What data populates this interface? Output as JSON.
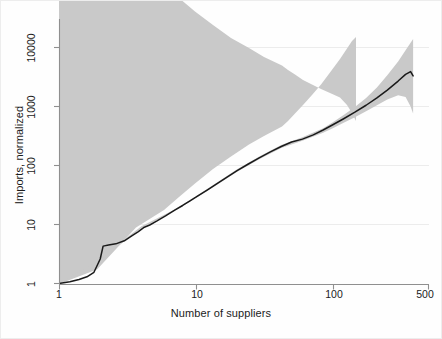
{
  "chart_data": {
    "type": "line",
    "title": "",
    "subtitle": "",
    "xlabel": "Number of suppliers",
    "ylabel": "Imports, normalized",
    "xscale": "log",
    "yscale": "log",
    "xlim": [
      1,
      500
    ],
    "ylim": [
      1,
      20000
    ],
    "grid": true,
    "grid_axis": "y",
    "legend": "none",
    "xticks": [
      1,
      10,
      100,
      500
    ],
    "xtick_labels": [
      "1",
      "10",
      "100",
      "500"
    ],
    "yticks": [
      1,
      10,
      100,
      1000,
      10000
    ],
    "ytick_labels": [
      "1",
      "10",
      "100",
      "1000",
      "10000"
    ],
    "annotations": [],
    "series": [
      {
        "name": "Imports, normalized (mean)",
        "style": "solid-line",
        "color": "#1a1a1a",
        "x": [
          1,
          1.2,
          1.4,
          1.6,
          1.8,
          2.0,
          2.1,
          2.3,
          2.6,
          3.0,
          3.4,
          3.8,
          4.2,
          4.6,
          5.2,
          6.0,
          7.0,
          8.0,
          9.0,
          10,
          12,
          14,
          17,
          20,
          24,
          29,
          35,
          42,
          50,
          60,
          72,
          85,
          100,
          120,
          145,
          175,
          210,
          250,
          300,
          340,
          370,
          386
        ],
        "y": [
          1.0,
          1.07,
          1.17,
          1.3,
          1.55,
          2.6,
          4.3,
          4.5,
          4.7,
          5.3,
          6.4,
          7.6,
          9.0,
          9.8,
          11.5,
          14.0,
          17.5,
          21.0,
          25.0,
          29.0,
          38.0,
          48.0,
          64.0,
          82.0,
          105,
          135,
          170,
          210,
          250,
          280,
          330,
          400,
          490,
          620,
          800,
          1050,
          1400,
          1900,
          2700,
          3500,
          3900,
          3300
        ]
      },
      {
        "name": "95% confidence band (upper)",
        "style": "band-upper",
        "color": "#c9c9c9",
        "x": [
          1,
          2,
          4,
          7,
          10,
          14,
          20,
          29,
          42,
          60,
          85,
          100,
          120,
          145,
          175,
          210,
          250,
          300,
          340,
          370,
          386
        ],
        "y": [
          1.0,
          2.7,
          9.3,
          18.0,
          30.0,
          50.0,
          86.0,
          142,
          222,
          300,
          430,
          540,
          720,
          980,
          1400,
          2100,
          3400,
          5800,
          9000,
          12000,
          14000
        ]
      },
      {
        "name": "95% confidence band (lower)",
        "style": "band-lower",
        "color": "#c9c9c9",
        "x": [
          1,
          2,
          4,
          7,
          10,
          14,
          20,
          29,
          42,
          60,
          85,
          100,
          120,
          145,
          175,
          210,
          250,
          300,
          340,
          370,
          386
        ],
        "y": [
          1.0,
          2.5,
          8.7,
          17.0,
          28.0,
          46.0,
          78.0,
          128,
          198,
          262,
          360,
          430,
          530,
          660,
          830,
          1050,
          1320,
          1550,
          1450,
          1000,
          760
        ]
      }
    ]
  },
  "axes": {
    "x_title": "Number of suppliers",
    "y_title": "Imports, normalized",
    "x_ticks": [
      {
        "label": "1",
        "value": 1
      },
      {
        "label": "10",
        "value": 10
      },
      {
        "label": "100",
        "value": 100
      },
      {
        "label": "500",
        "value": 500
      }
    ],
    "y_ticks": [
      {
        "label": "1",
        "value": 1
      },
      {
        "label": "10",
        "value": 10
      },
      {
        "label": "100",
        "value": 100
      },
      {
        "label": "1000",
        "value": 1000
      },
      {
        "label": "10000",
        "value": 10000
      }
    ]
  },
  "style": {
    "line_color": "#1a1a1a",
    "band_color": "#c9c9c9",
    "grid_color": "#ececec",
    "axis_color": "#9a9a9a",
    "background": "#fefefe",
    "text_color": "#1b1b1b"
  }
}
